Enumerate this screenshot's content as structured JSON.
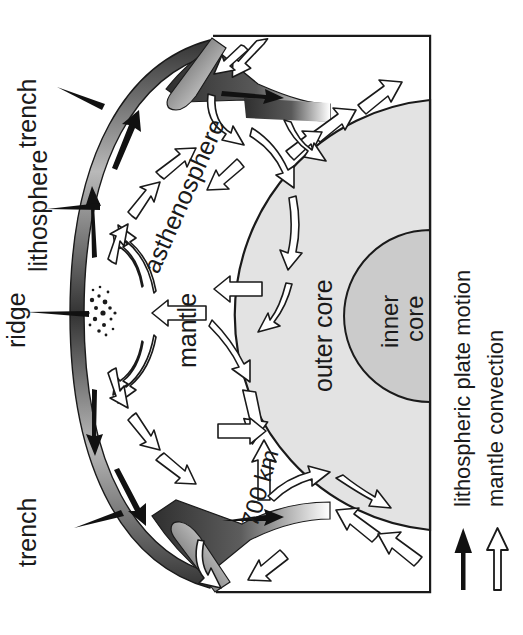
{
  "figure": {
    "background_color": "#ffffff",
    "outline_color": "#1a1a1a"
  },
  "layers": {
    "outer_core": {
      "label": "outer core",
      "fill": "#e0e0e0",
      "stroke": "#1a1a1a"
    },
    "inner_core": {
      "label": "inner core",
      "label_line_1": "inner",
      "label_line_2": "core",
      "fill": "#c9c9c9",
      "stroke": "#1a1a1a"
    },
    "mantle": {
      "label": "mantle",
      "fill": "#ffffff"
    },
    "asthenosphere": {
      "label": "asthenosphere"
    },
    "lithosphere": {
      "label": "lithosphere",
      "fill_dark": "#3a3a3a",
      "fill_light": "#d8d8d8"
    }
  },
  "annotations": {
    "trench_top": "trench",
    "trench_bottom": "trench",
    "ridge": "ridge",
    "depth_700": "700 km"
  },
  "legend": {
    "items": [
      {
        "label": "lithospheric plate motion",
        "arrow_style": "solid",
        "arrow_color": "#111111"
      },
      {
        "label": "mantle convection",
        "arrow_style": "hollow",
        "arrow_color": "#111111",
        "arrow_fill": "#ffffff"
      }
    ]
  }
}
